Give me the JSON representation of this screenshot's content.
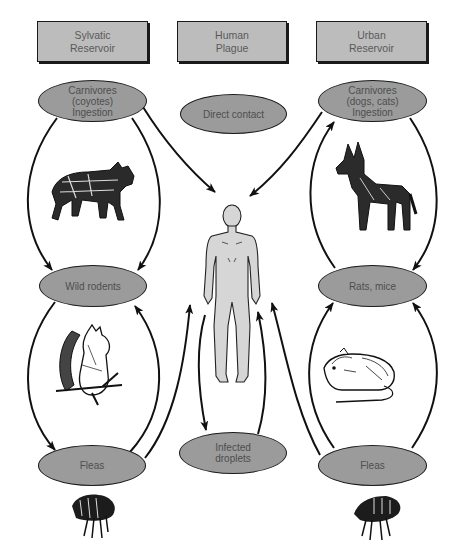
{
  "header_boxes": {
    "sylvatic": "Sylvatic\nReservoir",
    "human": "Human\nPlague",
    "urban": "Urban\nReservoir"
  },
  "nodes": {
    "sylvatic_carnivores": "Carnivores\n(coyotes)\nIngestion",
    "direct_contact": "Direct contact",
    "urban_carnivores": "Carnivores\n(dogs, cats)\nIngestion",
    "wild_rodents": "Wild rodents",
    "rats_mice": "Rats, mice",
    "sylvatic_fleas": "Fleas",
    "infected_droplets": "Infected\ndroplets",
    "urban_fleas": "Fleas"
  },
  "illustrations": {
    "coyote": "coyote",
    "dog": "dog",
    "squirrel": "squirrel",
    "rat": "rat",
    "human": "human figure",
    "flea_left": "flea",
    "flea_right": "flea"
  },
  "colors": {
    "box_fill": "#bcbcbc",
    "oval_fill": "#9b9b9b",
    "stroke": "#1a1a1a",
    "text": "#555555"
  }
}
